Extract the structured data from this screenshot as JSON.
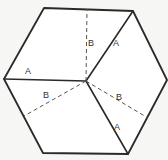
{
  "diagram": {
    "type": "hexagon-fold-diagram",
    "colors": {
      "line": "#2a2a2a",
      "dash": "#555555",
      "background": "#f6f6f4",
      "fill": "#ffffff",
      "label": "#333333"
    },
    "hexagon": {
      "vertices": [
        [
          44,
          8
        ],
        [
          133,
          11
        ],
        [
          167,
          80
        ],
        [
          128,
          154
        ],
        [
          43,
          153
        ],
        [
          4,
          79
        ]
      ]
    },
    "center": [
      86,
      81
    ],
    "solid_lines": [
      {
        "id": "A-left",
        "from": [
          86,
          81
        ],
        "to": [
          4,
          79
        ]
      },
      {
        "id": "A-top-right",
        "from": [
          86,
          81
        ],
        "to": [
          133,
          11
        ]
      },
      {
        "id": "A-bottom-right",
        "from": [
          86,
          81
        ],
        "to": [
          128,
          154
        ]
      }
    ],
    "dashed_lines": [
      {
        "id": "B-top",
        "from": [
          86,
          81
        ],
        "to": [
          87,
          9
        ]
      },
      {
        "id": "B-left",
        "from": [
          86,
          81
        ],
        "to": [
          24,
          116
        ]
      },
      {
        "id": "B-right",
        "from": [
          86,
          81
        ],
        "to": [
          148,
          118
        ]
      }
    ],
    "labels": [
      {
        "text": "A",
        "x": 28,
        "y": 74
      },
      {
        "text": "B",
        "x": 91,
        "y": 46
      },
      {
        "text": "A",
        "x": 116,
        "y": 46
      },
      {
        "text": "B",
        "x": 46,
        "y": 98
      },
      {
        "text": "B",
        "x": 119,
        "y": 100
      },
      {
        "text": "A",
        "x": 117,
        "y": 130
      }
    ]
  }
}
